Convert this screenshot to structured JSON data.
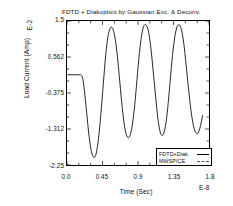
{
  "chart_data": {
    "type": "line",
    "title": "FDTD + Diakoptics by Gaussian Exc. & Deconv.",
    "xlabel": "Time (Sec)",
    "ylabel": "Load Current (Amp)",
    "y_exponent": "E-2",
    "x_exponent": "E-8",
    "xlim": [
      0.0,
      1.8
    ],
    "ylim": [
      -2.25,
      1.5
    ],
    "grid": false,
    "legend_position": "bottom-right",
    "xticks": [
      "0.0",
      "0.45",
      "0.9",
      "1.35",
      "1.8"
    ],
    "xtick_values": [
      0.0,
      0.45,
      0.9,
      1.35,
      1.8
    ],
    "yticks": [
      "1.5",
      "0.562",
      "-0.375",
      "-1.312",
      "-2.25"
    ],
    "ytick_values": [
      1.5,
      0.562,
      -0.375,
      -1.312,
      -2.25
    ],
    "series": [
      {
        "name": "FDTD+Diak.",
        "style": "solid",
        "color": "#000000",
        "x": [
          0.0,
          0.05,
          0.1,
          0.15,
          0.18,
          0.2,
          0.22,
          0.25,
          0.28,
          0.31,
          0.34,
          0.37,
          0.4,
          0.43,
          0.46,
          0.49,
          0.52,
          0.55,
          0.58,
          0.61,
          0.64,
          0.67,
          0.7,
          0.73,
          0.76,
          0.79,
          0.82,
          0.85,
          0.88,
          0.91,
          0.94,
          0.97,
          1.0,
          1.03,
          1.06,
          1.09,
          1.12,
          1.15,
          1.18,
          1.21,
          1.24,
          1.27,
          1.3,
          1.33,
          1.36,
          1.39,
          1.42,
          1.45,
          1.48,
          1.51,
          1.54,
          1.57,
          1.6,
          1.63,
          1.66,
          1.69,
          1.72
        ],
        "y": [
          0.1,
          0.1,
          0.1,
          0.1,
          0.09,
          0.0,
          -0.3,
          -0.9,
          -1.5,
          -1.9,
          -2.05,
          -1.95,
          -1.55,
          -0.9,
          -0.15,
          0.6,
          1.1,
          1.32,
          1.3,
          1.05,
          0.55,
          -0.1,
          -0.75,
          -1.25,
          -1.5,
          -1.52,
          -1.3,
          -0.85,
          -0.2,
          0.5,
          1.05,
          1.35,
          1.4,
          1.25,
          0.85,
          0.25,
          -0.4,
          -1.0,
          -1.38,
          -1.48,
          -1.32,
          -0.9,
          -0.25,
          0.45,
          1.0,
          1.32,
          1.4,
          1.28,
          0.92,
          0.35,
          -0.25,
          -0.8,
          -1.2,
          -1.4,
          -1.42,
          -1.25,
          -0.95
        ]
      },
      {
        "name": "MWSPICE",
        "style": "dashed",
        "color": "#555555"
      }
    ]
  },
  "legend": {
    "entries": [
      {
        "label": "FDTD+Diak.",
        "style": "solid"
      },
      {
        "label": "MWSPICE",
        "style": "dashed"
      }
    ]
  }
}
